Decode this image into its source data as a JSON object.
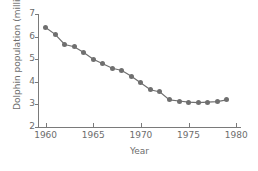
{
  "chart_data": {
    "type": "line",
    "title": "",
    "xlabel": "Year",
    "ylabel": "Dolphin population (millions)",
    "xlim": [
      1959.2,
      1980.4
    ],
    "ylim": [
      2,
      7
    ],
    "xticks": [
      1960,
      1965,
      1970,
      1975,
      1980
    ],
    "yticks": [
      2,
      3,
      4,
      5,
      6,
      7
    ],
    "xtick_labels": [
      "1960",
      "1965",
      "1970",
      "1975",
      "1980"
    ],
    "ytick_labels": [
      "2",
      "3",
      "4",
      "5",
      "6",
      "7"
    ],
    "grid": false,
    "legend": "none",
    "marker": "circle",
    "series_color": "#6f6f6f",
    "x": [
      1960,
      1961,
      1962,
      1963,
      1964,
      1965,
      1966,
      1967,
      1968,
      1969,
      1970,
      1971,
      1972,
      1973,
      1974,
      1975,
      1976,
      1977,
      1978,
      1979
    ],
    "values": [
      6.4,
      6.1,
      5.65,
      5.55,
      5.3,
      5.0,
      4.8,
      4.6,
      4.5,
      4.25,
      3.95,
      3.65,
      3.55,
      3.2,
      3.15,
      3.1,
      3.08,
      3.1,
      3.12,
      3.2
    ],
    "series": [
      {
        "name": "Dolphin population",
        "values": [
          6.4,
          6.1,
          5.65,
          5.55,
          5.3,
          5.0,
          4.8,
          4.6,
          4.5,
          4.25,
          3.95,
          3.65,
          3.55,
          3.2,
          3.15,
          3.1,
          3.08,
          3.1,
          3.12,
          3.2
        ]
      }
    ]
  },
  "axes": {
    "x_title": "Year",
    "y_title": "Dolphin population (millions)"
  }
}
